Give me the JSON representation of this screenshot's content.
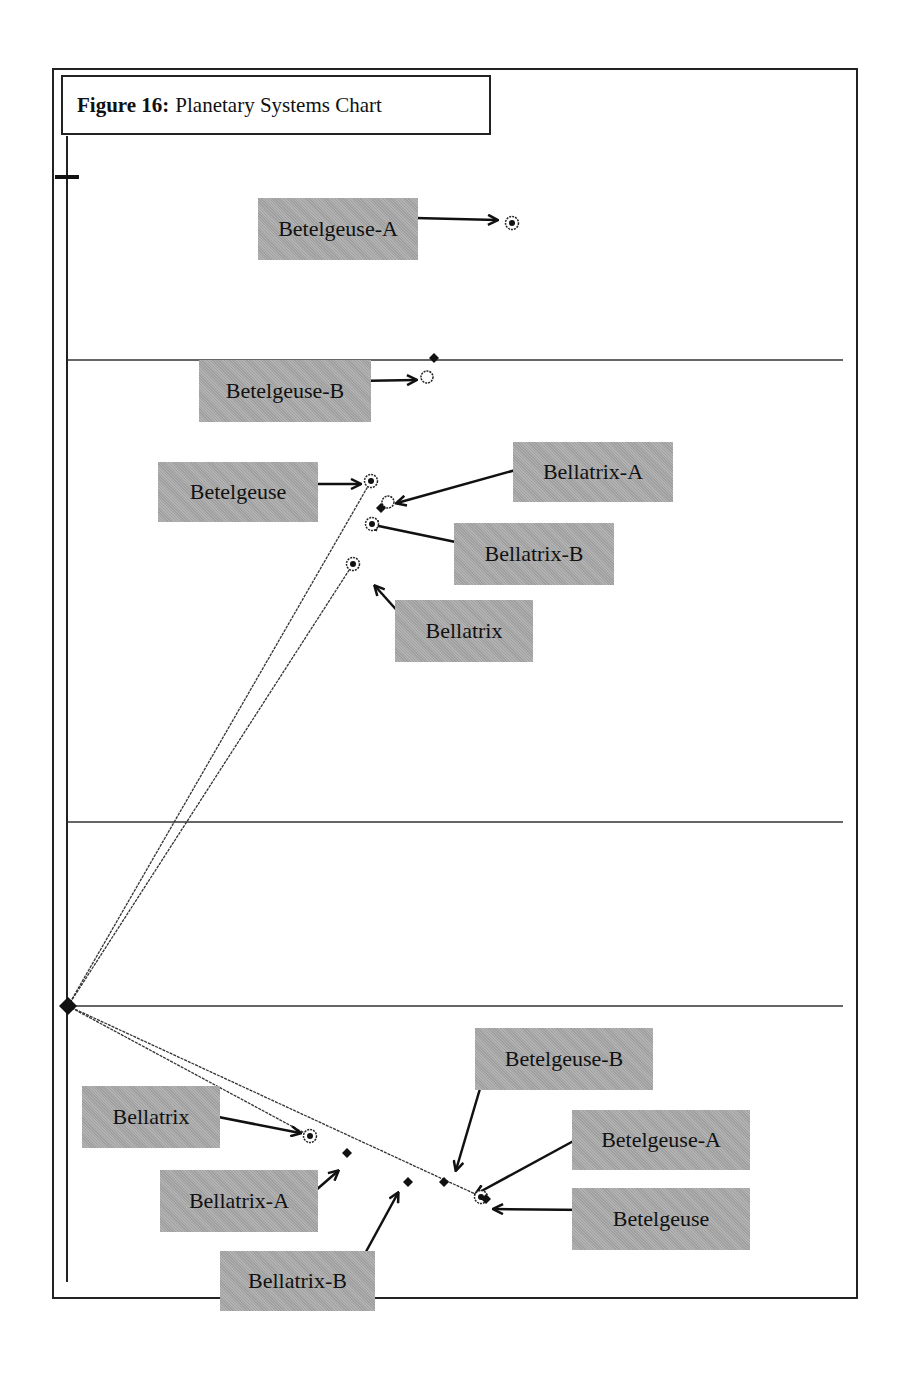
{
  "figure": {
    "title_bold": "Figure 16:",
    "title_rest": "Planetary Systems Chart"
  },
  "colors": {
    "label_bg": "#a9a9a9",
    "line": "#222222",
    "background": "#ffffff"
  },
  "chart_data": {
    "type": "scatter",
    "title": "Figure 16: Planetary Systems Chart",
    "xlabel": "",
    "ylabel": "",
    "grid": "horizontal",
    "origin_px": [
      68,
      1006
    ],
    "horizontal_gridlines_px_y": [
      360,
      822,
      1006
    ],
    "axis_tick_px_y": 177,
    "panels": [
      {
        "name": "upper",
        "points": [
          {
            "label": "Betelgeuse-A",
            "x": 512,
            "y": 223,
            "marker": "circle-dot"
          },
          {
            "label": "Betelgeuse-B",
            "x": 427,
            "y": 377,
            "marker": "open-circle"
          },
          {
            "label": "Betelgeuse-B (diamond)",
            "x": 434,
            "y": 358,
            "marker": "diamond"
          },
          {
            "label": "Betelgeuse",
            "x": 371,
            "y": 481,
            "marker": "circle-dot"
          },
          {
            "label": "Bellatrix-A",
            "x": 388,
            "y": 502,
            "marker": "open-circle"
          },
          {
            "label": "Bellatrix-A (diamond)",
            "x": 381,
            "y": 508,
            "marker": "diamond"
          },
          {
            "label": "Bellatrix-B",
            "x": 372,
            "y": 524,
            "marker": "circle-dot"
          },
          {
            "label": "Bellatrix",
            "x": 353,
            "y": 564,
            "marker": "circle-dot"
          }
        ]
      },
      {
        "name": "lower",
        "points": [
          {
            "label": "Bellatrix",
            "x": 310,
            "y": 1136,
            "marker": "circle-dot"
          },
          {
            "label": "Bellatrix-A",
            "x": 347,
            "y": 1153,
            "marker": "diamond"
          },
          {
            "label": "Bellatrix-B",
            "x": 408,
            "y": 1182,
            "marker": "diamond"
          },
          {
            "label": "Betelgeuse-B",
            "x": 444,
            "y": 1182,
            "marker": "diamond"
          },
          {
            "label": "Betelgeuse-A",
            "x": 481,
            "y": 1197,
            "marker": "circle-dot"
          },
          {
            "label": "Betelgeuse",
            "x": 486,
            "y": 1199,
            "marker": "diamond"
          }
        ]
      }
    ],
    "vectors": [
      {
        "from": [
          68,
          1006
        ],
        "to": [
          371,
          481
        ],
        "name": "origin-to-Betelgeuse"
      },
      {
        "from": [
          68,
          1006
        ],
        "to": [
          353,
          564
        ],
        "name": "origin-to-Bellatrix"
      },
      {
        "from": [
          68,
          1006
        ],
        "to": [
          486,
          1199
        ],
        "name": "origin-to-Betelgeuse-lower"
      },
      {
        "from": [
          68,
          1006
        ],
        "to": [
          310,
          1136
        ],
        "name": "origin-to-Bellatrix-lower"
      }
    ]
  },
  "labels": [
    {
      "id": "betelgeuse-a-top",
      "text": "Betelgeuse-A",
      "box": [
        258,
        198,
        160,
        62
      ],
      "arrow": {
        "from": [
          415,
          218
        ],
        "to": [
          497,
          220
        ]
      }
    },
    {
      "id": "betelgeuse-b-top",
      "text": "Betelgeuse-B",
      "box": [
        199,
        360,
        172,
        62
      ],
      "arrow": {
        "from": [
          355,
          381
        ],
        "to": [
          416,
          380
        ]
      }
    },
    {
      "id": "betelgeuse-top",
      "text": "Betelgeuse",
      "box": [
        158,
        462,
        160,
        60
      ],
      "arrow": {
        "from": [
          298,
          484
        ],
        "to": [
          360,
          484
        ]
      }
    },
    {
      "id": "bellatrix-a-top",
      "text": "Bellatrix-A",
      "box": [
        513,
        442,
        160,
        60
      ],
      "arrow": {
        "from": [
          530,
          466
        ],
        "to": [
          397,
          503
        ]
      }
    },
    {
      "id": "bellatrix-b-top",
      "text": "Bellatrix-B",
      "box": [
        454,
        523,
        160,
        62
      ],
      "arrow": {
        "from": [
          470,
          545
        ],
        "to": [
          369,
          524
        ]
      }
    },
    {
      "id": "bellatrix-top",
      "text": "Bellatrix",
      "box": [
        395,
        600,
        138,
        62
      ],
      "arrow": {
        "from": [
          410,
          625
        ],
        "to": [
          375,
          586
        ]
      }
    },
    {
      "id": "betelgeuse-b-bottom",
      "text": "Betelgeuse-B",
      "box": [
        475,
        1028,
        178,
        62
      ],
      "arrow": {
        "from": [
          492,
          1048
        ],
        "to": [
          456,
          1170
        ]
      }
    },
    {
      "id": "bellatrix-bottom",
      "text": "Bellatrix",
      "box": [
        82,
        1086,
        138,
        62
      ],
      "arrow": {
        "from": [
          198,
          1113
        ],
        "to": [
          300,
          1133
        ]
      }
    },
    {
      "id": "betelgeuse-a-bottom",
      "text": "Betelgeuse-A",
      "box": [
        572,
        1110,
        178,
        60
      ],
      "arrow": {
        "from": [
          590,
          1132
        ],
        "to": [
          476,
          1194
        ]
      }
    },
    {
      "id": "bellatrix-a-bottom",
      "text": "Bellatrix-A",
      "box": [
        160,
        1170,
        158,
        62
      ],
      "arrow": {
        "from": [
          300,
          1204
        ],
        "to": [
          338,
          1171
        ]
      }
    },
    {
      "id": "betelgeuse-bottom",
      "text": "Betelgeuse",
      "box": [
        572,
        1188,
        178,
        62
      ],
      "arrow": {
        "from": [
          590,
          1210
        ],
        "to": [
          494,
          1209
        ]
      }
    },
    {
      "id": "bellatrix-b-bottom",
      "text": "Bellatrix-B",
      "box": [
        220,
        1251,
        155,
        60
      ],
      "arrow": {
        "from": [
          356,
          1270
        ],
        "to": [
          398,
          1193
        ]
      }
    }
  ]
}
